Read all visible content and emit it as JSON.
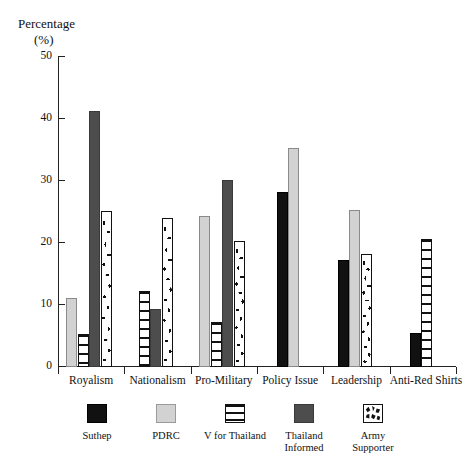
{
  "axis": {
    "y_title_line1": "Percentage",
    "y_title_line2": "(%)",
    "y_ticks": [
      "0",
      "10",
      "20",
      "30",
      "40",
      "50"
    ]
  },
  "legend": {
    "items": [
      {
        "label": "Suthep",
        "label2": "",
        "swatch": "swatch-black",
        "color": "#111111"
      },
      {
        "label": "PDRC",
        "label2": "",
        "swatch": "swatch-lightgray",
        "color": "#d2d2d2"
      },
      {
        "label": "V for Thailand",
        "label2": "",
        "swatch": "swatch-horizontal-stripe",
        "color": "#ffffff"
      },
      {
        "label": "Thailand",
        "label2": "Informed",
        "swatch": "swatch-darkgray",
        "color": "#4d4d4d"
      },
      {
        "label": "Army",
        "label2": "Supporter",
        "swatch": "swatch-mottled",
        "color": "#ffffff"
      }
    ]
  },
  "chart_data": {
    "type": "bar",
    "title": "",
    "xlabel": "",
    "ylabel": "Percentage (%)",
    "ylim": [
      0,
      50
    ],
    "grid": false,
    "legend_position": "bottom",
    "categories": [
      "Royalism",
      "Nationalism",
      "Pro-Military",
      "Policy Issue",
      "Leadership",
      "Anti-Red Shirts"
    ],
    "series": [
      {
        "name": "Suthep",
        "values": [
          0,
          0,
          0,
          28.3,
          17.3,
          5.5
        ]
      },
      {
        "name": "PDRC",
        "values": [
          11.2,
          0,
          24.3,
          35.3,
          25.3,
          0
        ]
      },
      {
        "name": "V for Thailand",
        "values": [
          5.4,
          12.2,
          7.2,
          0,
          0,
          20.7
        ]
      },
      {
        "name": "Thailand Informed",
        "values": [
          41.3,
          9.4,
          30.2,
          0,
          0,
          0
        ]
      },
      {
        "name": "Army Supporter",
        "values": [
          25.2,
          24.1,
          20.3,
          0,
          18.3,
          0
        ]
      }
    ]
  }
}
